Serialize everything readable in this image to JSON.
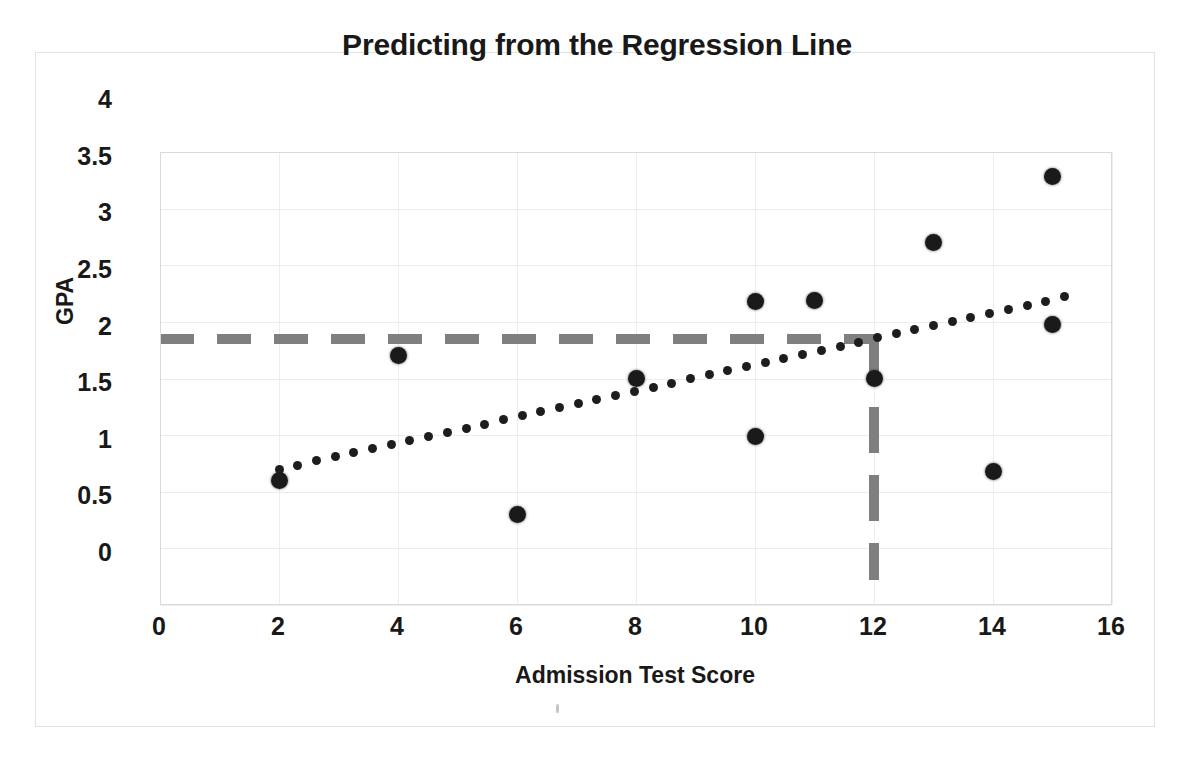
{
  "chart_data": {
    "type": "scatter",
    "title": "Predicting from the Regression Line",
    "xlabel": "Admission Test Score",
    "ylabel": "GPA",
    "xlim": [
      0,
      16
    ],
    "ylim": [
      0,
      4
    ],
    "grid": true,
    "legend": "none",
    "x_ticks": [
      "0",
      "2",
      "4",
      "6",
      "8",
      "10",
      "12",
      "14",
      "16"
    ],
    "x_tick_values": [
      0,
      2,
      4,
      6,
      8,
      10,
      12,
      14,
      16
    ],
    "y_ticks": [
      "0",
      "0.5",
      "1",
      "1.5",
      "2",
      "2.5",
      "3",
      "3.5",
      "4"
    ],
    "y_tick_values": [
      0,
      0.5,
      1,
      1.5,
      2,
      2.5,
      3,
      3.5,
      4
    ],
    "series": [
      {
        "name": "Students",
        "type": "scatter",
        "marker": "filled-circle",
        "color": "#1a1a1a",
        "points": [
          {
            "x": 2,
            "y": 1.1
          },
          {
            "x": 4,
            "y": 2.2
          },
          {
            "x": 6,
            "y": 0.8
          },
          {
            "x": 8,
            "y": 2.0
          },
          {
            "x": 10,
            "y": 2.68
          },
          {
            "x": 10,
            "y": 1.49
          },
          {
            "x": 11,
            "y": 2.69
          },
          {
            "x": 12,
            "y": 2.0
          },
          {
            "x": 13,
            "y": 3.2
          },
          {
            "x": 14,
            "y": 1.18
          },
          {
            "x": 15,
            "y": 3.78
          },
          {
            "x": 15,
            "y": 2.48
          }
        ]
      },
      {
        "name": "Regression Line",
        "type": "line",
        "style": "dotted",
        "color": "#1d1d1d",
        "x_start": 2.0,
        "x_end": 15.2,
        "y_start": 1.2,
        "y_end": 2.72,
        "slope": 0.1152,
        "intercept": 0.9697
      }
    ],
    "annotations": [
      {
        "name": "prediction-guide-horizontal",
        "type": "dashed-line",
        "orientation": "horizontal",
        "color": "#7f7f7f",
        "y": 2.35,
        "x_start": 0.0,
        "x_end": 12.0
      },
      {
        "name": "prediction-guide-vertical",
        "type": "dashed-line",
        "orientation": "vertical",
        "color": "#7f7f7f",
        "x": 12.0,
        "y_start": 0.22,
        "y_end": 2.35
      }
    ]
  },
  "colors": {
    "marker": "#1a1a1a",
    "trendline": "#1d1d1d",
    "guide": "#7f7f7f",
    "gridline": "#ededed",
    "plot_border": "#d9d9d9",
    "frame_border": "#e2e2e2",
    "background": "#ffffff",
    "text": "#191919"
  }
}
